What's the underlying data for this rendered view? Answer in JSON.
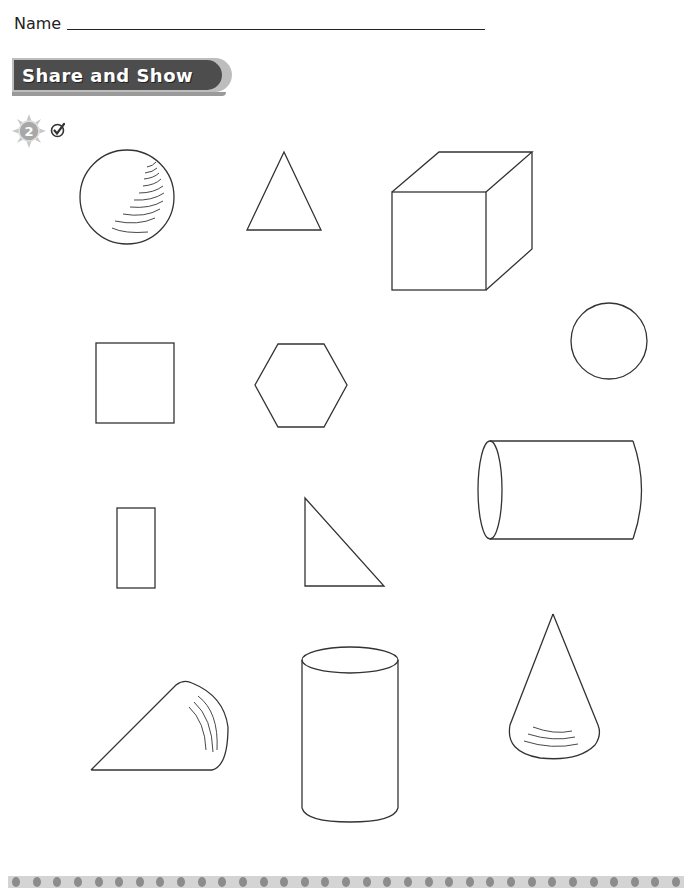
{
  "header": {
    "name_label": "Name",
    "section_title": "Share and Show",
    "problem_number": "2",
    "icons": [
      "sun-badge-icon",
      "check-mark-icon"
    ]
  },
  "colors": {
    "banner": "#4d4d4d",
    "banner_border": "#bdbdbd",
    "stroke": "#333333",
    "footer_dots": "#8c8c8c",
    "footer_band": "#d4d4d4"
  },
  "shapes": [
    {
      "type": "sphere",
      "kind": "3D"
    },
    {
      "type": "triangle",
      "kind": "2D"
    },
    {
      "type": "cube",
      "kind": "3D"
    },
    {
      "type": "square",
      "kind": "2D"
    },
    {
      "type": "hexagon",
      "kind": "2D"
    },
    {
      "type": "circle",
      "kind": "2D"
    },
    {
      "type": "cylinder",
      "kind": "3D",
      "orientation": "horizontal"
    },
    {
      "type": "rectangle",
      "kind": "2D"
    },
    {
      "type": "right-triangle",
      "kind": "2D"
    },
    {
      "type": "cone",
      "kind": "3D",
      "orientation": "sideways"
    },
    {
      "type": "cylinder",
      "kind": "3D",
      "orientation": "vertical"
    },
    {
      "type": "cone",
      "kind": "3D",
      "orientation": "upright"
    }
  ],
  "footer": {
    "dot_count": 33
  }
}
